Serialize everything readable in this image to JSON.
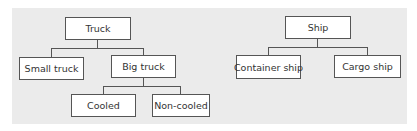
{
  "diagram": {
    "type": "hierarchy",
    "trees": [
      {
        "root": "Truck",
        "children": [
          {
            "label": "Small truck",
            "children": []
          },
          {
            "label": "Big truck",
            "children": [
              {
                "label": "Cooled"
              },
              {
                "label": "Non-cooled"
              }
            ]
          }
        ]
      },
      {
        "root": "Ship",
        "children": [
          {
            "label": "Container ship"
          },
          {
            "label": "Cargo ship"
          }
        ]
      }
    ]
  },
  "nodes": {
    "truck": "Truck",
    "small_truck": "Small truck",
    "big_truck": "Big truck",
    "cooled": "Cooled",
    "non_cooled": "Non-cooled",
    "ship": "Ship",
    "container_ship": "Container ship",
    "cargo_ship": "Cargo ship"
  },
  "colors": {
    "background": "#ebebeb",
    "box_fill": "#ffffff",
    "box_border": "#555555"
  }
}
